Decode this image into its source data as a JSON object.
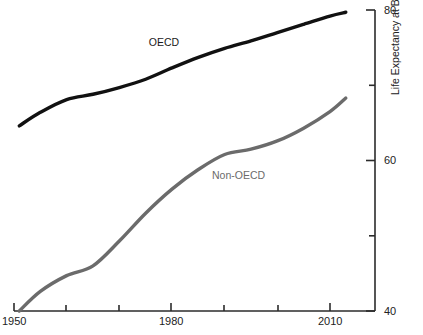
{
  "chart_data": {
    "type": "line",
    "title": "",
    "subtitle": "",
    "xlabel": "",
    "ylabel": "Life Expectancy at Birth, y",
    "xlim": [
      1950,
      2013
    ],
    "ylim": [
      40,
      80
    ],
    "grid": false,
    "legend_position": "inline-annotations",
    "y_axis_position": "right",
    "x_ticks": [
      1950,
      1960,
      1970,
      1980,
      1990,
      2000,
      2010
    ],
    "x_tick_labels": [
      "1950",
      "",
      "",
      "1980",
      "",
      "",
      "2010"
    ],
    "x_tick_labels_shown": [
      "1950",
      "1980",
      "2010"
    ],
    "y_ticks": [
      40,
      50,
      60,
      70,
      80
    ],
    "y_tick_labels": [
      "40",
      "",
      "60",
      "",
      "80"
    ],
    "y_tick_labels_shown": [
      "40",
      "60",
      "80"
    ],
    "y_minor_ticks": [
      50,
      70
    ],
    "series": [
      {
        "name": "OECD",
        "color": "#111111",
        "line_width": 3.4,
        "annotation": "OECD",
        "x": [
          1951,
          1955,
          1960,
          1965,
          1970,
          1975,
          1980,
          1985,
          1990,
          1995,
          2000,
          2005,
          2010,
          2013
        ],
        "values": [
          64.6,
          66.4,
          68.1,
          68.8,
          69.7,
          70.8,
          72.3,
          73.7,
          74.9,
          75.9,
          77.0,
          78.1,
          79.2,
          79.7
        ]
      },
      {
        "name": "Non-OECD",
        "color": "#6b6b6b",
        "line_width": 3.4,
        "annotation": "Non-OECD",
        "x": [
          1951,
          1955,
          1960,
          1965,
          1970,
          1975,
          1980,
          1985,
          1990,
          1995,
          2000,
          2005,
          2010,
          2013
        ],
        "values": [
          40.0,
          42.6,
          44.7,
          46.0,
          49.3,
          53.0,
          56.2,
          58.8,
          60.8,
          61.5,
          62.6,
          64.3,
          66.5,
          68.3
        ]
      }
    ],
    "annotations": [
      {
        "text": "OECD",
        "x": 1978,
        "y": 75.0,
        "color": "#1a1a1a"
      },
      {
        "text": "Non-OECD",
        "x": 1992,
        "y": 58.5,
        "color": "#6b6b6b"
      }
    ]
  },
  "axis": {
    "y_title": "Life Expectancy at Birth, y",
    "x_tick_1950": "1950",
    "x_tick_1980": "1980",
    "x_tick_2010": "2010",
    "y_tick_40": "40",
    "y_tick_60": "60",
    "y_tick_80": "80"
  },
  "labels": {
    "oecd": "OECD",
    "non_oecd": "Non-OECD"
  },
  "colors": {
    "oecd_line": "#111111",
    "non_oecd_line": "#6b6b6b",
    "axis": "#2b2b2b",
    "background": "#ffffff"
  }
}
